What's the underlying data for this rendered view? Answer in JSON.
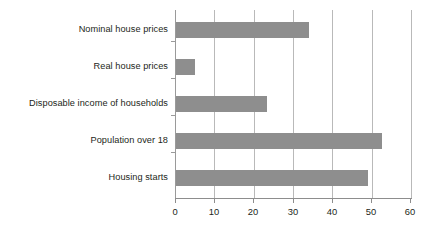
{
  "chart_data": {
    "type": "bar",
    "orientation": "horizontal",
    "title": "",
    "subtitle": "",
    "xlabel": "",
    "ylabel": "",
    "categories": [
      "Nominal house prices",
      "Real house prices",
      "Disposable income of households",
      "Population over 18",
      "Housing starts"
    ],
    "values": [
      34,
      5,
      23.5,
      52.5,
      49
    ],
    "xlim": [
      0,
      60
    ],
    "xticks": [
      0,
      10,
      20,
      30,
      40,
      50,
      60
    ],
    "xtick_labels": [
      "0",
      "10",
      "20",
      "30",
      "40",
      "50",
      "60"
    ],
    "grid": "vertical",
    "legend": "none",
    "series": [
      {
        "name": "",
        "values": [
          34,
          5,
          23.5,
          52.5,
          49
        ]
      }
    ],
    "colors": {
      "bar": "#8e8e8e",
      "gridline": "#b9b9b9",
      "axis": "#8d8d8d",
      "text": "#231f20",
      "background": "#ffffff"
    }
  }
}
